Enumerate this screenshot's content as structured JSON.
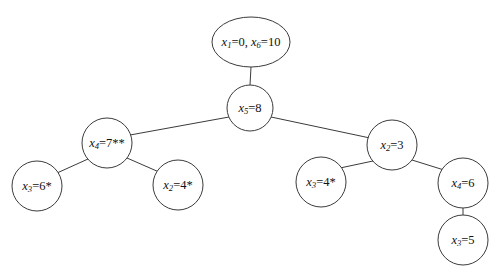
{
  "diagram": {
    "type": "branch-and-bound-tree",
    "background_color": "#ffffff",
    "stroke_color": "#3b3b3b",
    "text_color": "#111111",
    "nodes": [
      {
        "id": "root",
        "shape": "ellipse",
        "cx": 251,
        "cy": 42,
        "rx": 39,
        "ry": 25,
        "label": "x1=0, x6=10",
        "var1": "x",
        "sub1": "1",
        "eq1": "=0, ",
        "var2": "x",
        "sub2": "6",
        "eq2": "=10",
        "asterisks": ""
      },
      {
        "id": "n-x5",
        "shape": "circle",
        "cx": 250,
        "cy": 108,
        "rx": 23,
        "ry": 23,
        "label": "x5=8",
        "var1": "x",
        "sub1": "5",
        "eq1": "=8",
        "asterisks": ""
      },
      {
        "id": "n-x4-7",
        "shape": "circle",
        "cx": 107,
        "cy": 143,
        "rx": 25,
        "ry": 25,
        "label": "x4=7**",
        "var1": "x",
        "sub1": "4",
        "eq1": "=7",
        "asterisks": "**"
      },
      {
        "id": "n-x3-6",
        "shape": "circle",
        "cx": 37,
        "cy": 186,
        "rx": 25,
        "ry": 25,
        "label": "x3=6*",
        "var1": "x",
        "sub1": "3",
        "eq1": "=6",
        "asterisks": "*"
      },
      {
        "id": "n-x2-4",
        "shape": "circle",
        "cx": 178,
        "cy": 185,
        "rx": 25,
        "ry": 25,
        "label": "x2=4*",
        "var1": "x",
        "sub1": "2",
        "eq1": "=4",
        "asterisks": "*"
      },
      {
        "id": "n-x2-3",
        "shape": "circle",
        "cx": 392,
        "cy": 145,
        "rx": 25,
        "ry": 25,
        "label": "x2=3",
        "var1": "x",
        "sub1": "2",
        "eq1": "=3",
        "asterisks": ""
      },
      {
        "id": "n-x3-4",
        "shape": "circle",
        "cx": 321,
        "cy": 182,
        "rx": 25,
        "ry": 25,
        "label": "x3=4*",
        "var1": "x",
        "sub1": "3",
        "eq1": "=4",
        "asterisks": "*"
      },
      {
        "id": "n-x4-6",
        "shape": "circle",
        "cx": 463,
        "cy": 183,
        "rx": 25,
        "ry": 25,
        "label": "x4=6",
        "var1": "x",
        "sub1": "4",
        "eq1": "=6",
        "asterisks": ""
      },
      {
        "id": "n-x3-5",
        "shape": "circle",
        "cx": 463,
        "cy": 240,
        "rx": 25,
        "ry": 25,
        "label": "x3=5",
        "var1": "x",
        "sub1": "3",
        "eq1": "=5",
        "asterisks": ""
      }
    ],
    "edges": [
      {
        "id": "edge-root-x5",
        "from": "root",
        "to": "n-x5",
        "x1": 251,
        "y1": 67,
        "x2": 250,
        "y2": 85
      },
      {
        "id": "edge-x5-x4",
        "from": "n-x5",
        "to": "n-x4-7",
        "x1": 229,
        "y1": 117,
        "x2": 130,
        "y2": 135
      },
      {
        "id": "edge-x5-x2",
        "from": "n-x5",
        "to": "n-x2-3",
        "x1": 271,
        "y1": 117,
        "x2": 370,
        "y2": 138
      },
      {
        "id": "edge-x4-x3",
        "from": "n-x4-7",
        "to": "n-x3-6",
        "x1": 88,
        "y1": 159,
        "x2": 57,
        "y2": 173
      },
      {
        "id": "edge-x4-x2",
        "from": "n-x4-7",
        "to": "n-x2-4",
        "x1": 127,
        "y1": 158,
        "x2": 159,
        "y2": 172
      },
      {
        "id": "edge-x2-x3",
        "from": "n-x2-3",
        "to": "n-x3-4",
        "x1": 373,
        "y1": 161,
        "x2": 340,
        "y2": 168
      },
      {
        "id": "edge-x2-x4",
        "from": "n-x2-3",
        "to": "n-x4-6",
        "x1": 412,
        "y1": 160,
        "x2": 444,
        "y2": 170
      },
      {
        "id": "edge-x4-x3-5",
        "from": "n-x4-6",
        "to": "n-x3-5",
        "x1": 463,
        "y1": 208,
        "x2": 463,
        "y2": 215
      }
    ]
  }
}
